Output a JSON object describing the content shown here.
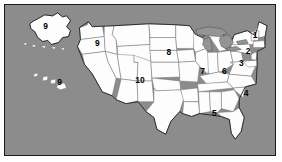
{
  "map": {
    "title": "United States Federal Regions Map",
    "background_color": "#8c8c8c",
    "land_color": "#fdfdfd",
    "border_color": "#1a1a1a",
    "state_line_color": "#6b6b6b",
    "lake_fill": "hatch-pattern",
    "frame": {
      "x": 4,
      "y": 4,
      "width": 272,
      "height": 152
    }
  },
  "regions": [
    {
      "id": "region-1",
      "label": "1",
      "x": 252,
      "y": 33,
      "area": "New England (Maine, New Hampshire, Vermont, Massachusetts, Rhode Island, Connecticut)"
    },
    {
      "id": "region-2",
      "label": "2",
      "x": 245,
      "y": 50,
      "area": "New York, New Jersey"
    },
    {
      "id": "region-3",
      "label": "3",
      "x": 238,
      "y": 62,
      "area": "Pennsylvania, Maryland, Delaware, Virginia, West Virginia"
    },
    {
      "id": "region-4",
      "label": "4",
      "x": 243,
      "y": 92,
      "area": "Southeast (North Carolina, South Carolina)"
    },
    {
      "id": "region-5",
      "label": "5",
      "x": 211,
      "y": 112,
      "area": "Deep South (Alabama, Georgia, Florida, Mississippi, Tennessee, Kentucky)"
    },
    {
      "id": "region-6",
      "label": "6",
      "x": 221,
      "y": 70,
      "area": "Ohio, Michigan"
    },
    {
      "id": "region-7",
      "label": "7",
      "x": 199,
      "y": 70,
      "area": "Illinois, Indiana, Wisconsin"
    },
    {
      "id": "region-8",
      "label": "8",
      "x": 165,
      "y": 51,
      "area": "Upper Plains (North Dakota, South Dakota, Nebraska, Minnesota, Iowa)"
    },
    {
      "id": "region-9-northwest",
      "label": "9",
      "x": 93,
      "y": 42,
      "area": "Pacific Northwest (Washington, Oregon, Idaho)"
    },
    {
      "id": "region-9-alaska",
      "label": "9",
      "x": 41,
      "y": 24,
      "area": "Alaska"
    },
    {
      "id": "region-9-hawaii",
      "label": "9",
      "x": 55,
      "y": 81,
      "area": "Hawaii"
    },
    {
      "id": "region-10",
      "label": "10",
      "x": 136,
      "y": 79,
      "area": "Mountain West / Southwest (Colorado, Utah, Nevada, Arizona, New Mexico, Kansas)"
    }
  ]
}
